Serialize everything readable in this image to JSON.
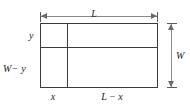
{
  "figure": {
    "type": "geometry-diagram",
    "background_color": "#ffffff",
    "line_color": "#3a3a3a",
    "dimension_line_color": "#8a8a8a",
    "label_color": "#1c1c1c"
  },
  "labels": {
    "length_total": "L",
    "width_total": "W",
    "height_upper": "y",
    "height_lower": "W− y",
    "width_left": "x",
    "width_right": "L − x"
  },
  "chart_data": {
    "type": "diagram",
    "outer_rect": {
      "length": "L",
      "width": "W"
    },
    "vertical_division": {
      "left_segment": "x",
      "right_segment": "L − x"
    },
    "horizontal_division": {
      "top_segment": "y",
      "bottom_segment": "W − y"
    },
    "cells": [
      {
        "position": "top-left",
        "width": "x",
        "height": "y"
      },
      {
        "position": "top-right",
        "width": "L − x",
        "height": "y"
      },
      {
        "position": "bottom-left",
        "width": "x",
        "height": "W − y"
      },
      {
        "position": "bottom-right",
        "width": "L − x",
        "height": "W − y"
      }
    ]
  }
}
